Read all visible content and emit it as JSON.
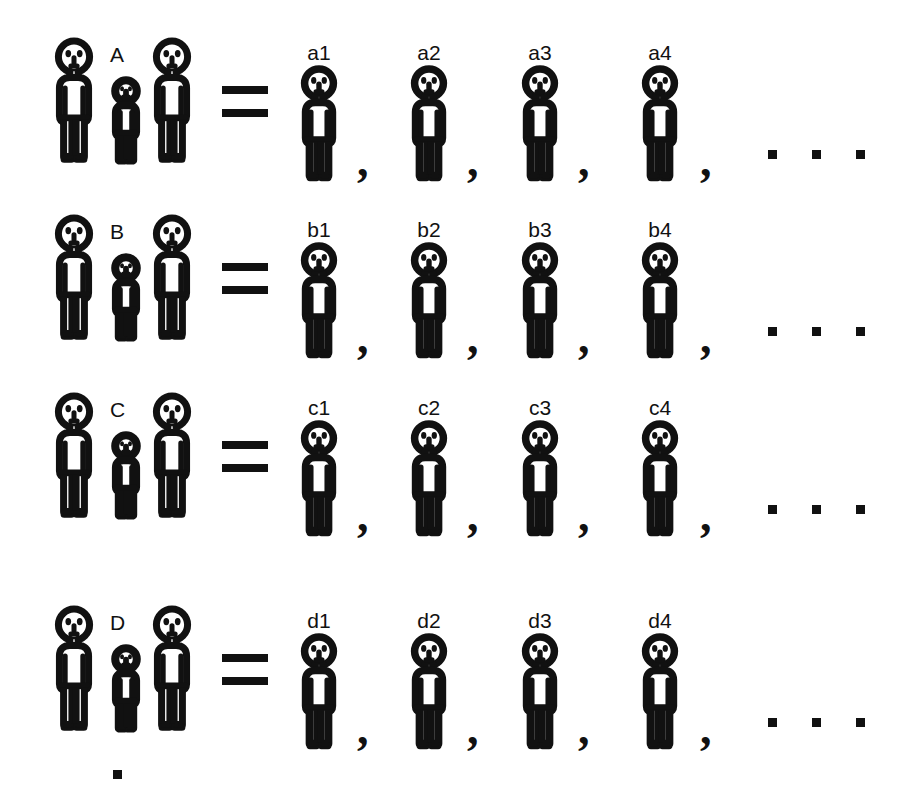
{
  "diagram": {
    "equals_symbol": "=",
    "comma_symbol": ",",
    "ink_color": "#111111",
    "background_color": "#ffffff",
    "horizontal_ellipsis_dots": 3,
    "vertical_ellipsis_dots": 1,
    "rows": [
      {
        "group_label": "A",
        "group_members": [
          "adult",
          "child",
          "adult"
        ],
        "members": [
          {
            "label": "a1"
          },
          {
            "label": "a2"
          },
          {
            "label": "a3"
          },
          {
            "label": "a4"
          }
        ]
      },
      {
        "group_label": "B",
        "group_members": [
          "adult",
          "child",
          "adult"
        ],
        "members": [
          {
            "label": "b1"
          },
          {
            "label": "b2"
          },
          {
            "label": "b3"
          },
          {
            "label": "b4"
          }
        ]
      },
      {
        "group_label": "C",
        "group_members": [
          "adult",
          "child",
          "adult"
        ],
        "members": [
          {
            "label": "c1"
          },
          {
            "label": "c2"
          },
          {
            "label": "c3"
          },
          {
            "label": "c4"
          }
        ]
      },
      {
        "group_label": "D",
        "group_members": [
          "adult",
          "child",
          "adult"
        ],
        "members": [
          {
            "label": "d1"
          },
          {
            "label": "d2"
          },
          {
            "label": "d3"
          },
          {
            "label": "d4"
          }
        ]
      }
    ]
  }
}
